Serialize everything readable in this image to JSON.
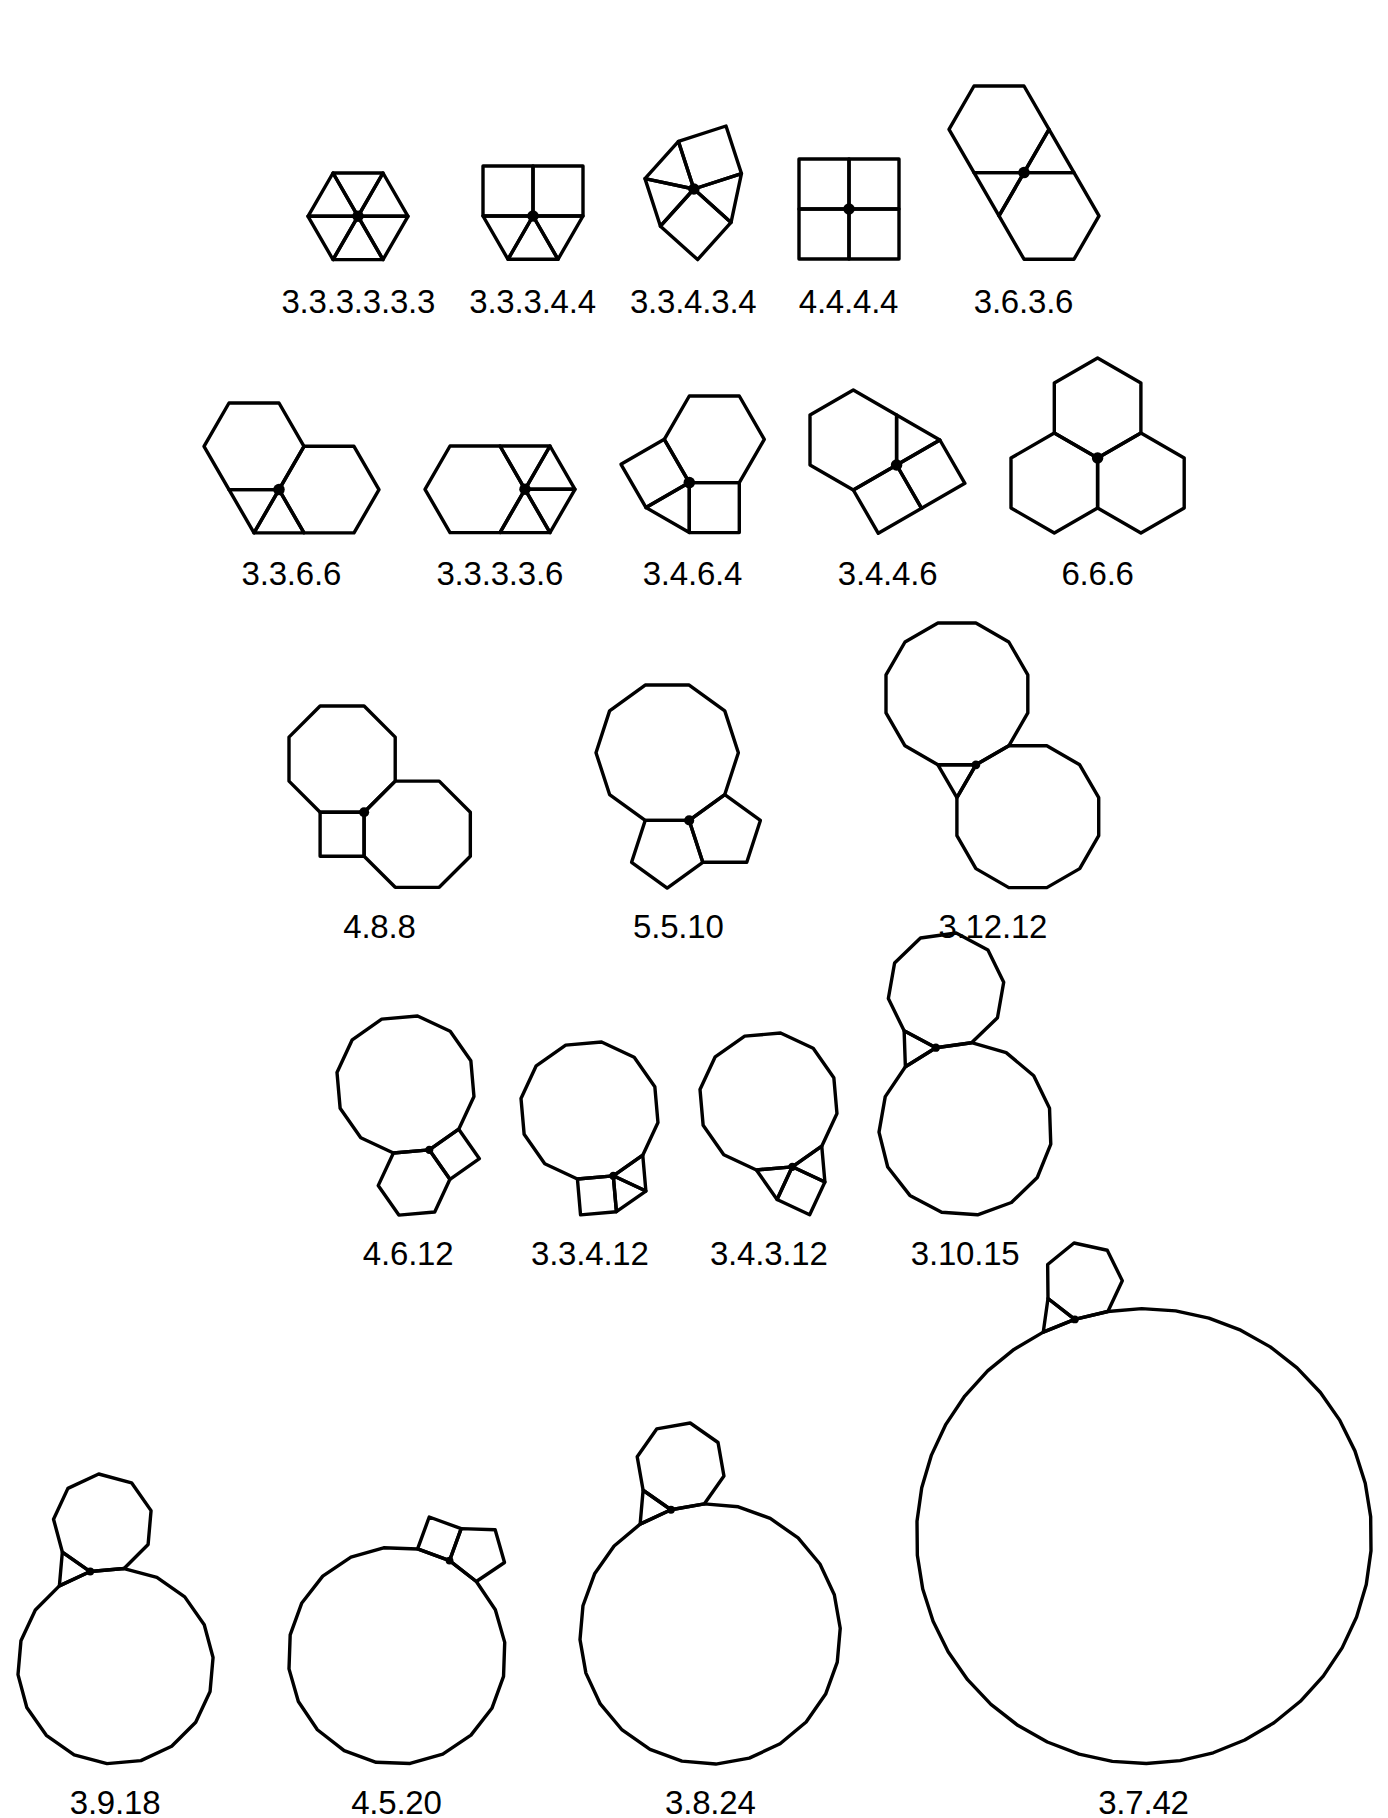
{
  "figure": {
    "background_color": "#ffffff",
    "line_color": "#000000",
    "vertex_dot_color": "#000000",
    "caption_font_size_px": 33
  },
  "chart_data": {
    "type": "diagram",
    "rows": [
      {
        "row_index": 0,
        "y": 78,
        "cells": [
          {
            "label": "3.3.3.3.3.3",
            "polygons": [
              3,
              3,
              3,
              3,
              3,
              3
            ],
            "scale": 50,
            "start_angle": 0,
            "caption_gap": 18
          },
          {
            "label": "3.3.3.4.4",
            "polygons": [
              4,
              4,
              3,
              3,
              3
            ],
            "scale": 50,
            "start_angle": 180,
            "caption_gap": 18
          },
          {
            "label": "3.3.4.3.4",
            "polygons": [
              3,
              4,
              3,
              4,
              3
            ],
            "scale": 50,
            "start_angle": 192,
            "caption_gap": 18
          },
          {
            "label": "4.4.4.4",
            "polygons": [
              4,
              4,
              4,
              4
            ],
            "scale": 50,
            "start_angle": 0,
            "caption_gap": 18
          },
          {
            "label": "3.6.3.6",
            "polygons": [
              6,
              3,
              6,
              3
            ],
            "scale": 50,
            "start_angle": 0,
            "caption_gap": 18
          }
        ]
      },
      {
        "row_index": 1,
        "y": 350,
        "cells": [
          {
            "label": "3.3.6.6",
            "polygons": [
              6,
              6,
              3,
              3
            ],
            "scale": 50,
            "start_angle": 180,
            "caption_gap": 16
          },
          {
            "label": "3.3.3.3.6",
            "polygons": [
              6,
              3,
              3,
              3,
              3
            ],
            "scale": 50,
            "start_angle": 120,
            "caption_gap": 16
          },
          {
            "label": "3.4.6.4",
            "polygons": [
              6,
              4,
              3,
              4
            ],
            "scale": 50,
            "start_angle": 240,
            "caption_gap": 16
          },
          {
            "label": "3.4.4.6",
            "polygons": [
              6,
              3,
              4,
              4
            ],
            "scale": 50,
            "start_angle": 150,
            "caption_gap": 16
          },
          {
            "label": "6.6.6",
            "polygons": [
              6,
              6,
              6
            ],
            "scale": 50,
            "start_angle": 90,
            "caption_gap": 16
          }
        ]
      },
      {
        "row_index": 2,
        "y": 615,
        "cells": [
          {
            "label": "4.8.8",
            "polygons": [
              8,
              8,
              4
            ],
            "scale": 44,
            "start_angle": 180,
            "caption_gap": 14
          },
          {
            "label": "5.5.10",
            "polygons": [
              10,
              5,
              5
            ],
            "scale": 44,
            "start_angle": 180,
            "caption_gap": 14
          },
          {
            "label": "3.12.12",
            "polygons": [
              12,
              12,
              3
            ],
            "scale": 38,
            "start_angle": 180,
            "caption_gap": 14
          }
        ]
      },
      {
        "row_index": 3,
        "y": 925,
        "cells": [
          {
            "label": "4.6.12",
            "polygons": [
              12,
              4,
              6
            ],
            "scale": 36,
            "start_angle": 175,
            "caption_gap": 14
          },
          {
            "label": "3.3.4.12",
            "polygons": [
              12,
              3,
              3,
              4
            ],
            "scale": 36,
            "start_angle": 175,
            "caption_gap": 14
          },
          {
            "label": "3.4.3.12",
            "polygons": [
              12,
              3,
              4,
              3
            ],
            "scale": 36,
            "start_angle": 175,
            "caption_gap": 14
          },
          {
            "label": "3.10.15",
            "polygons": [
              10,
              15,
              3
            ],
            "scale": 36,
            "start_angle": 208,
            "caption_gap": 14
          }
        ]
      },
      {
        "row_index": 4,
        "y": 1235,
        "cells": [
          {
            "label": "3.9.18",
            "polygons": [
              9,
              18,
              3
            ],
            "scale": 34,
            "start_angle": 215,
            "caption_gap": 14
          },
          {
            "label": "4.5.20",
            "polygons": [
              4,
              5,
              20
            ],
            "scale": 34,
            "start_angle": 200,
            "caption_gap": 14
          },
          {
            "label": "3.8.24",
            "polygons": [
              8,
              24,
              3
            ],
            "scale": 34,
            "start_angle": 215,
            "caption_gap": 14
          },
          {
            "label": "3.7.42",
            "polygons": [
              7,
              42,
              3
            ],
            "scale": 34,
            "start_angle": 218,
            "caption_gap": 14
          }
        ]
      }
    ]
  }
}
